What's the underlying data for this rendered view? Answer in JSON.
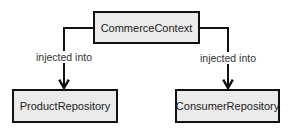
{
  "diagram": {
    "nodes": {
      "context": {
        "label": "CommerceContext"
      },
      "product": {
        "label": "ProductRepository"
      },
      "consumer": {
        "label": "ConsumerRepository"
      }
    },
    "edges": [
      {
        "from": "CommerceContext",
        "to": "ProductRepository",
        "label": "injected into"
      },
      {
        "from": "CommerceContext",
        "to": "ConsumerRepository",
        "label": "injected into"
      }
    ],
    "colors": {
      "box_fill": "#ebebeb",
      "stroke": "#111111"
    }
  }
}
